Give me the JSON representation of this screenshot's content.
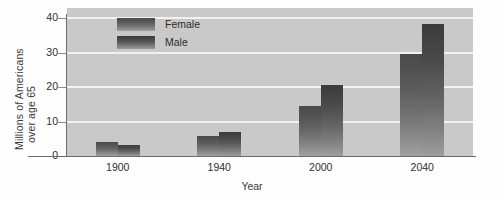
{
  "chart_data": {
    "type": "bar",
    "title": "",
    "xlabel": "Year",
    "ylabel": "Millions of Americans over age 65",
    "ylabel_line1": "Millions of Americans",
    "ylabel_line2": "over age 65",
    "categories": [
      "1900",
      "1940",
      "2000",
      "2040"
    ],
    "series": [
      {
        "name": "Female",
        "values": [
          4.0,
          5.8,
          14.5,
          29.5
        ]
      },
      {
        "name": "Male",
        "values": [
          3.2,
          7.0,
          20.5,
          38.5
        ]
      }
    ],
    "yticks": [
      0,
      10,
      20,
      30,
      40
    ],
    "ytick_labels": [
      "0",
      "10",
      "20",
      "30",
      "40"
    ],
    "ylim": [
      0,
      43
    ],
    "grid": "horizontal",
    "legend_position": "top-left-inside",
    "colors": {
      "plot_background": "#c9c9c9",
      "gridline": "#f2f2f2",
      "female_bar_top": "#4a4a4a",
      "female_bar_bottom": "#a2a2a2",
      "male_bar_top": "#3b3b3b",
      "male_bar_bottom": "#9e9e9e",
      "axis": "#6b6b6b",
      "text": "#2e2e2e"
    }
  },
  "legend": {
    "entries": [
      {
        "label": "Female"
      },
      {
        "label": "Male"
      }
    ]
  }
}
